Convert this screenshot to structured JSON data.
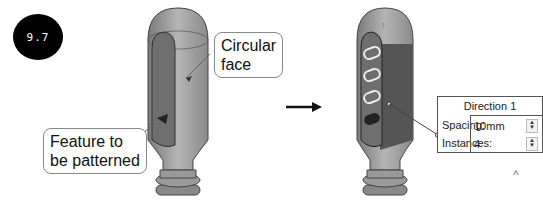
{
  "figure_number": "9.7",
  "callouts": {
    "circular_face": "Circular\nface",
    "circular_face_line1": "Circular",
    "circular_face_line2": "face",
    "feature_line1": "Feature to",
    "feature_line2": "be patterned"
  },
  "panel": {
    "title": "Direction 1",
    "spacing_label": "Spacing:",
    "spacing_value": "10mm",
    "instances_label": "Instances:",
    "instances_value": "4"
  },
  "colors": {
    "body": "#a8a8a8",
    "dark_face": "#6e6e6e",
    "selected_face": "#555555"
  }
}
